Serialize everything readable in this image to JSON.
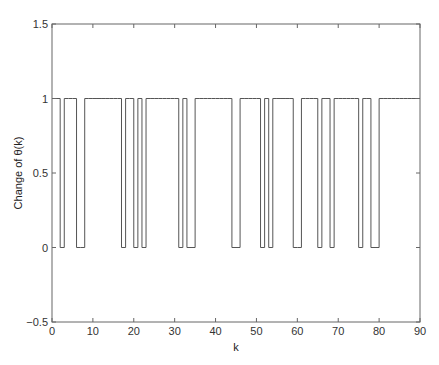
{
  "chart_data": {
    "type": "line",
    "subtype": "stairs",
    "title": "",
    "xlabel": "k",
    "ylabel": "Change of θ(k)",
    "xlim": [
      0,
      90
    ],
    "ylim": [
      -0.5,
      1.5
    ],
    "xticks": [
      0,
      10,
      20,
      30,
      40,
      50,
      60,
      70,
      80,
      90
    ],
    "xtick_labels": [
      "0",
      "10",
      "20",
      "30",
      "40",
      "50",
      "60",
      "70",
      "80",
      "90"
    ],
    "yticks": [
      -0.5,
      0,
      0.5,
      1,
      1.5
    ],
    "ytick_labels": [
      "−0.5",
      "0",
      "0.5",
      "1",
      "1.5"
    ],
    "grid": false,
    "legend": null,
    "line_color": "#555555",
    "zero_intervals": [
      [
        2,
        3
      ],
      [
        6,
        8
      ],
      [
        17,
        18
      ],
      [
        20,
        21
      ],
      [
        22,
        23
      ],
      [
        31,
        32
      ],
      [
        33,
        35
      ],
      [
        44,
        46
      ],
      [
        51,
        52
      ],
      [
        53,
        54
      ],
      [
        59,
        61
      ],
      [
        65,
        66
      ],
      [
        68,
        69
      ],
      [
        75,
        76
      ],
      [
        78,
        80
      ]
    ],
    "x": [
      0,
      1,
      2,
      3,
      4,
      5,
      6,
      7,
      8,
      9,
      10,
      11,
      12,
      13,
      14,
      15,
      16,
      17,
      18,
      19,
      20,
      21,
      22,
      23,
      24,
      25,
      26,
      27,
      28,
      29,
      30,
      31,
      32,
      33,
      34,
      35,
      36,
      37,
      38,
      39,
      40,
      41,
      42,
      43,
      44,
      45,
      46,
      47,
      48,
      49,
      50,
      51,
      52,
      53,
      54,
      55,
      56,
      57,
      58,
      59,
      60,
      61,
      62,
      63,
      64,
      65,
      66,
      67,
      68,
      69,
      70,
      71,
      72,
      73,
      74,
      75,
      76,
      77,
      78,
      79,
      80,
      81,
      82,
      83,
      84,
      85,
      86,
      87,
      88,
      89,
      90
    ],
    "values": [
      1,
      1,
      0,
      1,
      1,
      1,
      0,
      0,
      1,
      1,
      1,
      1,
      1,
      1,
      1,
      1,
      1,
      0,
      1,
      1,
      0,
      1,
      0,
      1,
      1,
      1,
      1,
      1,
      1,
      1,
      1,
      0,
      1,
      0,
      0,
      1,
      1,
      1,
      1,
      1,
      1,
      1,
      1,
      1,
      0,
      0,
      1,
      1,
      1,
      1,
      1,
      0,
      1,
      0,
      1,
      1,
      1,
      1,
      1,
      0,
      0,
      1,
      1,
      1,
      1,
      0,
      1,
      1,
      0,
      1,
      1,
      1,
      1,
      1,
      1,
      0,
      1,
      1,
      0,
      0,
      1,
      1,
      1,
      1,
      1,
      1,
      1,
      1,
      1,
      1,
      1
    ]
  }
}
